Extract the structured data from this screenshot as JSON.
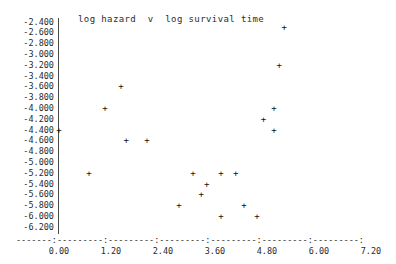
{
  "chart_data": {
    "type": "scatter",
    "title": "log hazard  v  log survival time",
    "xlabel": "",
    "ylabel": "",
    "xlim": [
      -0.6,
      7.8
    ],
    "ylim": [
      -6.35,
      -2.3
    ],
    "grid": false,
    "legend": null,
    "marker": "+",
    "x_ticks": [
      "0.00",
      "1.20",
      "2.40",
      "3.60",
      "4.80",
      "6.00",
      "7.20"
    ],
    "x_tick_values": [
      0.0,
      1.2,
      2.4,
      3.6,
      4.8,
      6.0,
      7.2
    ],
    "y_ticks": [
      "-2.400",
      "-2.600",
      "-2.800",
      "-3.000",
      "-3.200",
      "-3.400",
      "-3.600",
      "-3.800",
      "-4.000",
      "-4.200",
      "-4.400",
      "-4.600",
      "-4.800",
      "-5.000",
      "-5.200",
      "-5.400",
      "-5.600",
      "-5.800",
      "-6.000",
      "-6.200"
    ],
    "y_tick_values": [
      -2.4,
      -2.6,
      -2.8,
      -3.0,
      -3.2,
      -3.4,
      -3.6,
      -3.8,
      -4.0,
      -4.2,
      -4.4,
      -4.6,
      -4.8,
      -5.0,
      -5.2,
      -5.4,
      -5.6,
      -5.8,
      -6.0,
      -6.2
    ],
    "x_axis_dash_line": "-------:---------:---------:---------:---------:---------:---------:",
    "points": [
      {
        "x": 0.0,
        "y": -4.4
      },
      {
        "x": 1.06,
        "y": -4.0
      },
      {
        "x": 1.43,
        "y": -3.6
      },
      {
        "x": 0.69,
        "y": -5.2
      },
      {
        "x": 1.55,
        "y": -4.6
      },
      {
        "x": 2.03,
        "y": -4.6
      },
      {
        "x": 3.09,
        "y": -5.2
      },
      {
        "x": 3.74,
        "y": -5.2
      },
      {
        "x": 4.08,
        "y": -5.2
      },
      {
        "x": 3.41,
        "y": -5.4
      },
      {
        "x": 3.28,
        "y": -5.6
      },
      {
        "x": 2.77,
        "y": -5.8
      },
      {
        "x": 3.74,
        "y": -6.0
      },
      {
        "x": 4.57,
        "y": -6.0
      },
      {
        "x": 4.27,
        "y": -5.8
      },
      {
        "x": 4.96,
        "y": -4.4
      },
      {
        "x": 4.72,
        "y": -4.2
      },
      {
        "x": 4.96,
        "y": -4.0
      },
      {
        "x": 5.08,
        "y": -3.2
      },
      {
        "x": 5.2,
        "y": -2.5
      }
    ]
  }
}
